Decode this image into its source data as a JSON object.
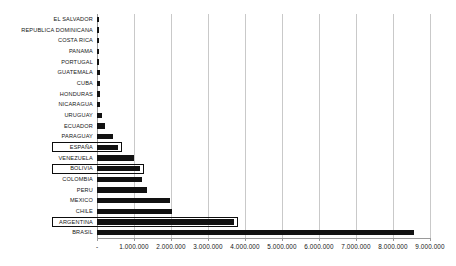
{
  "chart_data": {
    "type": "bar",
    "orientation": "horizontal",
    "title": "",
    "subtitle": "",
    "xlabel": "",
    "ylabel": "",
    "xlim": [
      0,
      9000000
    ],
    "grid": true,
    "legend": null,
    "axis_tick_labels": [
      "-",
      "1.000.000",
      "2.000.000",
      "3.000.000",
      "4.000.000",
      "5.000.000",
      "6.000.000",
      "7.000.000",
      "8.000.000",
      "9.000.000"
    ],
    "axis_tick_values": [
      0,
      1000000,
      2000000,
      3000000,
      4000000,
      5000000,
      6000000,
      7000000,
      8000000,
      9000000
    ],
    "categories": [
      "EL SALVADOR",
      "REPUBLICA DOMINICANA",
      "COSTA RICA",
      "PANAMA",
      "PORTUGAL",
      "GUATEMALA",
      "CUBA",
      "HONDURAS",
      "NICARAGUA",
      "URUGUAY",
      "ECUADOR",
      "PARAGUAY",
      "ESPAÑA",
      "VENEZUELA",
      "BOLIVIA",
      "COLOMBIA",
      "PERU",
      "MEXICO",
      "CHILE",
      "ARGENTINA",
      "BRASIL"
    ],
    "values": [
      30000,
      45000,
      50000,
      55000,
      62000,
      70000,
      75000,
      82000,
      90000,
      140000,
      205000,
      430000,
      560000,
      1000000,
      1170000,
      1215000,
      1360000,
      1960000,
      2020000,
      3700000,
      8580000
    ],
    "highlighted_categories": [
      "ESPAÑA",
      "BOLIVIA",
      "ARGENTINA"
    ],
    "bar_color": "#121212",
    "highlight_outline_color": "#0d0d0d",
    "gridline_color": "#c9c9c9",
    "background_color": "#ffffff"
  }
}
